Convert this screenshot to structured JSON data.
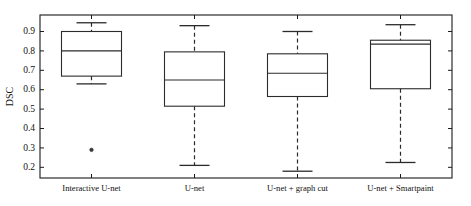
{
  "chart_data": {
    "type": "box",
    "title": "",
    "xlabel": "",
    "ylabel": "DSC",
    "ylim": [
      0.145,
      0.985
    ],
    "yticks": [
      0.2,
      0.3,
      0.4,
      0.5,
      0.6,
      0.7,
      0.8,
      0.9
    ],
    "ytick_labels": [
      "0.2",
      "0.3",
      "0.4",
      "0.5",
      "0.6",
      "0.7",
      "0.8",
      "0.9"
    ],
    "grid": false,
    "legend": null,
    "categories": [
      "Interactive U-net",
      "U-net",
      "U-net + graph cut",
      "U-net + Smartpaint"
    ],
    "boxes": [
      {
        "name": "Interactive U-net",
        "whisker_low": 0.63,
        "q1": 0.67,
        "median": 0.8,
        "q3": 0.9,
        "whisker_high": 0.945,
        "outliers": [
          0.29
        ]
      },
      {
        "name": "U-net",
        "whisker_low": 0.21,
        "q1": 0.515,
        "median": 0.65,
        "q3": 0.795,
        "whisker_high": 0.93,
        "outliers": []
      },
      {
        "name": "U-net + graph cut",
        "whisker_low": 0.18,
        "q1": 0.565,
        "median": 0.685,
        "q3": 0.785,
        "whisker_high": 0.9,
        "outliers": []
      },
      {
        "name": "U-net + Smartpaint",
        "whisker_low": 0.225,
        "q1": 0.605,
        "median": 0.835,
        "q3": 0.855,
        "whisker_high": 0.935,
        "outliers": []
      }
    ],
    "style": {
      "box_line_color": "#2b2b2b",
      "whisker_style": "dashed",
      "axis_color": "#1a1a1a",
      "background": "#ffffff"
    }
  }
}
